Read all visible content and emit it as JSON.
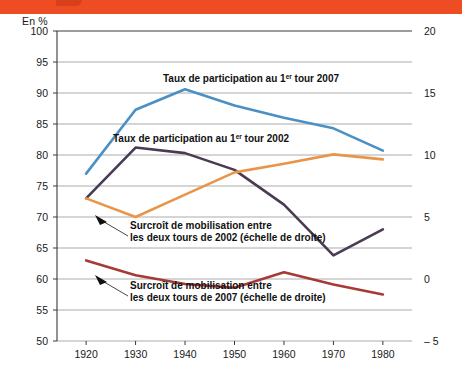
{
  "banner": {
    "color": "#ee4d24"
  },
  "axes": {
    "unit_label": "En %",
    "left_ticks": [
      100,
      95,
      90,
      85,
      80,
      75,
      70,
      65,
      60,
      55,
      50
    ],
    "right_ticks": [
      "20",
      "15",
      "10",
      "5",
      "0",
      "– 5"
    ],
    "x_ticks": [
      1920,
      1930,
      1940,
      1950,
      1960,
      1970,
      1980
    ]
  },
  "annotations": {
    "blue": "Taux de participation au 1",
    "blue_sup": "er",
    "blue_tail": " tour 2007",
    "purple": "Taux de participation au 1",
    "purple_sup": "er",
    "purple_tail": " tour 2002",
    "orange_l1": "Surcroît de mobilisation entre",
    "orange_l2": "les deux tours de 2002 (échelle de droite)",
    "darkred_l1": "Surcroît de mobilisation entre",
    "darkred_l2": "les deux tours de 2007 (échelle de droite)"
  },
  "chart_data": {
    "type": "line",
    "title": "",
    "xlabel": "",
    "ylabel": "En %",
    "x": [
      1920,
      1930,
      1940,
      1950,
      1960,
      1970,
      1980
    ],
    "ylim": [
      50,
      100
    ],
    "ylim_right": [
      -5,
      20
    ],
    "grid": true,
    "legend": "inline-annotations",
    "series": [
      {
        "name": "Taux de participation au 1er tour 2007",
        "color": "#4a90c4",
        "axis": "left",
        "values": [
          77.0,
          87.3,
          90.6,
          88.0,
          86.0,
          84.3,
          80.7
        ]
      },
      {
        "name": "Taux de participation au 1er tour 2002",
        "color": "#4a3b52",
        "axis": "left",
        "values": [
          73.0,
          81.2,
          80.3,
          77.6,
          72.0,
          63.8,
          68.0
        ]
      },
      {
        "name": "Surcroît de mobilisation entre les deux tours de 2002 (échelle de droite)",
        "color": "#e8954a",
        "axis": "right",
        "values": [
          73.0,
          70.0,
          73.6,
          77.2,
          78.6,
          80.1,
          79.3
        ],
        "values_right_scale": [
          6.5,
          5.0,
          6.8,
          8.6,
          9.3,
          10.0,
          9.6
        ]
      },
      {
        "name": "Surcroît de mobilisation entre les deux tours de 2007 (échelle de droite)",
        "color": "#a63a35",
        "axis": "right",
        "values": [
          63.0,
          60.6,
          59.2,
          58.6,
          61.1,
          59.1,
          57.5
        ],
        "values_right_scale": [
          1.5,
          0.3,
          -0.4,
          -0.7,
          0.55,
          -0.45,
          -1.25
        ]
      }
    ]
  }
}
